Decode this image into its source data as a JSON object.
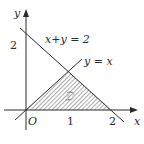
{
  "figure": {
    "type": "region-diagram",
    "axes": {
      "x_label": "x",
      "y_label": "y",
      "origin_label": "O",
      "x_ticks": [
        "1",
        "2"
      ],
      "y_ticks": [
        "2"
      ]
    },
    "lines": [
      {
        "equation": "x+y = 2",
        "label": "x+y = 2"
      },
      {
        "equation": "y = x",
        "label": "y = x"
      }
    ],
    "region": {
      "label": "D",
      "vertices": [
        [
          0,
          0
        ],
        [
          1,
          1
        ],
        [
          2,
          0
        ]
      ],
      "fill": "hatched"
    },
    "colors": {
      "stroke": "#2a2a2a",
      "hatch": "#555555",
      "background": "#ffffff"
    }
  }
}
